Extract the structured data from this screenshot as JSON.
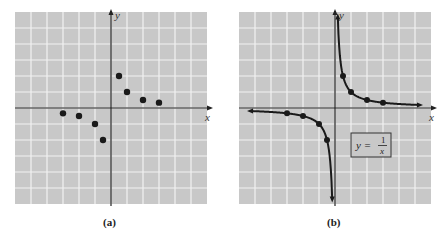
{
  "chart_data": [
    {
      "type": "scatter",
      "panel_label": "(a)",
      "title": "",
      "xlabel": "x",
      "ylabel": "y",
      "xlim": [
        -6,
        6
      ],
      "ylim": [
        -6,
        6
      ],
      "grid": true,
      "points": [
        {
          "x": -3,
          "y": -0.333
        },
        {
          "x": -2,
          "y": -0.5
        },
        {
          "x": -1,
          "y": -1
        },
        {
          "x": -0.5,
          "y": -2
        },
        {
          "x": 0.5,
          "y": 2
        },
        {
          "x": 1,
          "y": 1
        },
        {
          "x": 2,
          "y": 0.5
        },
        {
          "x": 3,
          "y": 0.333
        }
      ]
    },
    {
      "type": "line",
      "panel_label": "(b)",
      "title": "",
      "xlabel": "x",
      "ylabel": "y",
      "xlim": [
        -6,
        6
      ],
      "ylim": [
        -6,
        6
      ],
      "grid": true,
      "function": "y = 1/x",
      "annotation": {
        "text": "y = 1/x",
        "lhs": "y =",
        "numerator": "1",
        "denominator": "x"
      },
      "marked_points": [
        {
          "x": -3,
          "y": -0.333
        },
        {
          "x": -2,
          "y": -0.5
        },
        {
          "x": -1,
          "y": -1
        },
        {
          "x": -0.5,
          "y": -2
        },
        {
          "x": 0.5,
          "y": 2
        },
        {
          "x": 1,
          "y": 1
        },
        {
          "x": 2,
          "y": 0.5
        },
        {
          "x": 3,
          "y": 0.333
        }
      ]
    }
  ],
  "panels": {
    "a": {
      "caption": "(a)",
      "x_label": "x",
      "y_label": "y"
    },
    "b": {
      "caption": "(b)",
      "x_label": "x",
      "y_label": "y",
      "eq_lhs": "y =",
      "eq_num": "1",
      "eq_den": "x"
    }
  },
  "colors": {
    "grid_bg": "#c8c8c8",
    "grid_line": "#f2f2f2",
    "axis": "#222222",
    "point": "#1a1a1a"
  }
}
